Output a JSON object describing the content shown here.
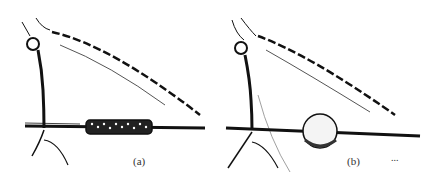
{
  "figure": {
    "panels": [
      {
        "id": "a",
        "label": "(a)",
        "description": "thread with spindle-shaped beaded swelling"
      },
      {
        "id": "b",
        "label": "(b)",
        "description": "thread with spherical globule"
      }
    ],
    "footnote": "..."
  }
}
